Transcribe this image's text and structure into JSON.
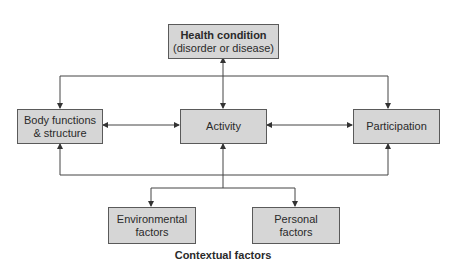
{
  "diagram": {
    "health": {
      "title": "Health condition",
      "subtitle": "(disorder or disease)"
    },
    "body": {
      "line1": "Body functions",
      "line2": "& structure"
    },
    "activity": {
      "label": "Activity"
    },
    "participation": {
      "label": "Participation"
    },
    "environmental": {
      "line1": "Environmental",
      "line2": "factors"
    },
    "personal": {
      "line1": "Personal",
      "line2": "factors"
    },
    "contextual_label": "Contextual factors"
  },
  "colors": {
    "box_fill": "#d6d6d6",
    "box_border": "#5a5a5a",
    "line": "#444444"
  }
}
